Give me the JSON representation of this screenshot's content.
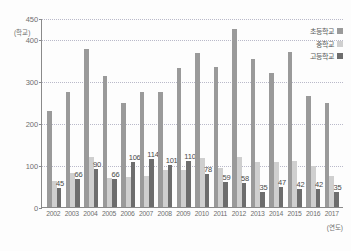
{
  "chart_data": {
    "type": "bar",
    "title": "",
    "xlabel": "(연도)",
    "ylabel": "(학교)",
    "ylim": [
      0,
      450
    ],
    "yticks": [
      0,
      100,
      200,
      300,
      400,
      450
    ],
    "gridlines": [
      100,
      200,
      300,
      450
    ],
    "grid": true,
    "legend_position": "top-right",
    "categories": [
      "2002",
      "2003",
      "2004",
      "2005",
      "2006",
      "2007",
      "2008",
      "2009",
      "2010",
      "2011",
      "2012",
      "2013",
      "2014",
      "2015",
      "2016",
      "2017"
    ],
    "series": [
      {
        "name": "초등학교",
        "color": "#9a9a9a",
        "values": [
          228,
          273,
          377,
          312,
          247,
          273,
          273,
          330,
          367,
          333,
          425,
          352,
          320,
          370,
          265,
          248
        ],
        "labels": [
          "",
          "",
          "",
          "",
          "",
          "",
          "",
          "",
          "",
          "",
          "",
          "",
          "",
          "",
          "",
          ""
        ]
      },
      {
        "name": "중학교",
        "color": "#cfcfcf",
        "values": [
          62,
          82,
          118,
          70,
          72,
          75,
          87,
          88,
          117,
          93,
          118,
          107,
          108,
          110,
          98,
          74
        ],
        "labels": [
          "",
          "",
          "",
          "",
          "",
          "",
          "",
          "",
          "",
          "",
          "",
          "",
          "",
          "",
          "",
          ""
        ]
      },
      {
        "name": "고등학교",
        "color": "#6d6d6d",
        "values": [
          45,
          66,
          90,
          66,
          106,
          114,
          101,
          110,
          78,
          59,
          58,
          35,
          47,
          42,
          42,
          35
        ],
        "labels": [
          "45",
          "66",
          "90",
          "66",
          "106",
          "114",
          "101",
          "110",
          "78",
          "59",
          "58",
          "35",
          "47",
          "42",
          "42",
          "35"
        ]
      }
    ]
  },
  "axis": {
    "y_unit": "(학교)",
    "x_unit": "(연도)",
    "y_tick_labels": [
      "450",
      "400",
      "300",
      "200",
      "100",
      "0"
    ]
  },
  "legend": {
    "items": [
      {
        "label": "초등학교"
      },
      {
        "label": "중학교"
      },
      {
        "label": "고등학교"
      }
    ]
  }
}
